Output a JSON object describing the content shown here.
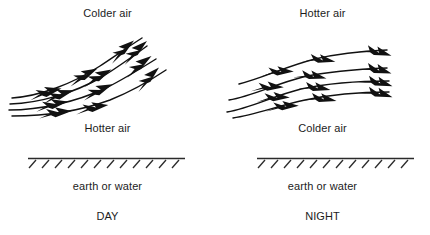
{
  "figure": {
    "background_color": "#ffffff",
    "ink_color": "#111111",
    "panels": [
      {
        "id": "day",
        "period_label": "DAY",
        "top_air_label": "Colder air",
        "mid_air_label": "Hotter air",
        "ground_label": "earth or water",
        "flow_description": "Four streamlines curving steeply upward to the right, each carrying three barbed arrowheads",
        "streamline_count": 4,
        "arrowheads_per_streamline": 3,
        "flow_direction": "rising to the right"
      },
      {
        "id": "night",
        "period_label": "NIGHT",
        "top_air_label": "Hotter air",
        "mid_air_label": "Colder air",
        "ground_label": "earth or water",
        "flow_description": "Four nearly horizontal streamlines drifting slightly upward to the right, each carrying two to three barbed arrowheads",
        "streamline_count": 4,
        "arrowheads_per_streamline": 3,
        "flow_direction": "nearly level to the right"
      }
    ],
    "ground": {
      "hatch_count": 12,
      "hatch_direction": "slanted up to the right, drawn below the surface line"
    }
  }
}
